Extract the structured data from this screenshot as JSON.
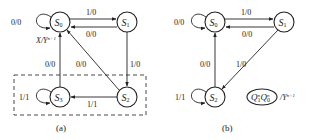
{
  "diagram_a": {
    "caption": "(a)",
    "states": {
      "s0": {
        "name": "S",
        "sub": "0"
      },
      "s1": {
        "name": "S",
        "sub": "1"
      },
      "s2": {
        "name": "S",
        "sub": "2"
      },
      "s3": {
        "name": "S",
        "sub": "3"
      }
    },
    "transitions": {
      "s0_self": "0/0",
      "s0_to_s1": "1/0",
      "s1_to_s0": "0/0",
      "s1_to_s2": "1/0",
      "s3_to_s0": "0/0",
      "s2_to_s0": "0/0",
      "s2_to_s3": "1/1",
      "s3_self": "1/1"
    },
    "io_legend": {
      "text": "X/Y",
      "sup": "n+1"
    }
  },
  "diagram_b": {
    "caption": "(b)",
    "states": {
      "s0": {
        "name": "S",
        "sub": "0"
      },
      "s1": {
        "name": "S",
        "sub": "1"
      },
      "s2": {
        "name": "S",
        "sub": "2"
      }
    },
    "transitions": {
      "s0_self": "0/0",
      "s0_to_s1": "1/0",
      "s1_to_s0": "0/0",
      "s1_to_s2": "1/0",
      "s2_to_s0": "0/0",
      "s2_self": "1/1"
    },
    "legend": {
      "q1": "Q",
      "q1_sub": "1",
      "q1_sup": "n",
      "q0": "Q",
      "q0_sub": "0",
      "q0_sup": "n",
      "output": "/Y",
      "output_sup": "n+1"
    }
  }
}
